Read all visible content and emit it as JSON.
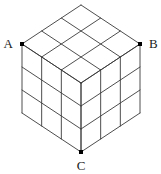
{
  "figure": {
    "type": "isometric-cube-wireframe",
    "divisions": 3,
    "background_color": "#ffffff",
    "line_color": "#3a3a3a",
    "line_width": 0.9,
    "vertex_marker_color": "#000000",
    "vertex_marker_size": 4,
    "label_color": "#1a1a1a",
    "geometry": {
      "top_apex": {
        "x": 81,
        "y": 5
      },
      "left_corner": {
        "x": 22,
        "y": 44
      },
      "right_corner": {
        "x": 140,
        "y": 44
      },
      "front_center": {
        "x": 81,
        "y": 83
      },
      "bottom_left": {
        "x": 22,
        "y": 113
      },
      "bottom_right": {
        "x": 140,
        "y": 113
      },
      "bottom_apex": {
        "x": 81,
        "y": 152
      }
    },
    "vertices": [
      {
        "id": "A",
        "label": "A",
        "x": 22,
        "y": 44,
        "label_x": 13,
        "label_y": 48,
        "anchor": "end"
      },
      {
        "id": "B",
        "label": "B",
        "x": 140,
        "y": 44,
        "label_x": 149,
        "label_y": 48,
        "anchor": "start"
      },
      {
        "id": "C",
        "label": "C",
        "x": 81,
        "y": 152,
        "label_x": 81,
        "label_y": 170,
        "anchor": "middle"
      }
    ],
    "faces": [
      {
        "name": "top-face",
        "shape": "rhombus",
        "grid": "3x3"
      },
      {
        "name": "left-face",
        "shape": "rhombus",
        "grid": "3x3"
      },
      {
        "name": "right-face",
        "shape": "rhombus",
        "grid": "3x3"
      }
    ]
  }
}
